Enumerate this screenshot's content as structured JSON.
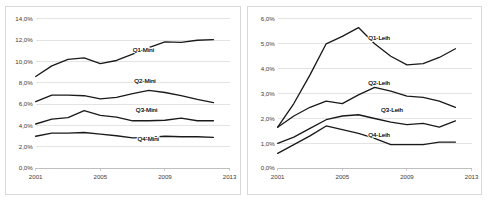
{
  "page": {
    "background_color": "#ffffff",
    "frame_border_color": "#d9d9d9",
    "line_color": "#1a1a1a",
    "gridline_color": "#d0d0d0"
  },
  "chart_data": [
    {
      "type": "line",
      "id": "chart-left-mini",
      "title": "",
      "xlabel": "",
      "ylabel": "",
      "grid": true,
      "legend_position": "inline-labels",
      "xlim": [
        2001,
        2013
      ],
      "ylim": [
        0,
        14
      ],
      "ytick_labels": [
        "0,0%",
        "2,0%",
        "4,0%",
        "6,0%",
        "8,0%",
        "10,0%",
        "12,0%",
        "14,0%"
      ],
      "ytick_values": [
        0,
        2,
        4,
        6,
        8,
        10,
        12,
        14
      ],
      "xtick_labels": [
        "2001",
        "2005",
        "2009",
        "2013"
      ],
      "xtick_values": [
        2001,
        2005,
        2009,
        2013
      ],
      "x": [
        2001,
        2002,
        2003,
        2004,
        2005,
        2006,
        2007,
        2008,
        2009,
        2010,
        2011,
        2012
      ],
      "series": [
        {
          "name": "Q1-Mini",
          "label": "Q1-Mini",
          "label_x": 2007.0,
          "label_y": 10.9,
          "values": [
            8.6,
            9.6,
            10.2,
            10.35,
            9.8,
            10.1,
            10.7,
            11.3,
            11.85,
            11.8,
            12.0,
            12.05
          ]
        },
        {
          "name": "Q2-Mini",
          "label": "Q2-Mini",
          "label_x": 2007.1,
          "label_y": 8.0,
          "values": [
            6.25,
            6.85,
            6.85,
            6.8,
            6.5,
            6.65,
            7.0,
            7.3,
            7.1,
            6.8,
            6.45,
            6.15
          ]
        },
        {
          "name": "Q3-Mini",
          "label": "Q3-Mini",
          "label_x": 2007.2,
          "label_y": 5.25,
          "values": [
            4.15,
            4.6,
            4.75,
            5.4,
            4.95,
            4.8,
            4.45,
            4.45,
            4.5,
            4.7,
            4.45,
            4.45
          ]
        },
        {
          "name": "Q4-Mini",
          "label": "Q4-Mini",
          "label_x": 2007.3,
          "label_y": 2.55,
          "values": [
            3.0,
            3.3,
            3.3,
            3.35,
            3.2,
            3.05,
            2.85,
            2.9,
            3.0,
            2.95,
            2.95,
            2.9
          ]
        }
      ]
    },
    {
      "type": "line",
      "id": "chart-right-leih",
      "title": "",
      "xlabel": "",
      "ylabel": "",
      "grid": true,
      "legend_position": "inline-labels",
      "xlim": [
        2001,
        2013
      ],
      "ylim": [
        0,
        6
      ],
      "ytick_labels": [
        "0,0%",
        "1,0%",
        "2,0%",
        "3,0%",
        "4,0%",
        "5,0%",
        "6,0%"
      ],
      "ytick_values": [
        0,
        1,
        2,
        3,
        4,
        5,
        6
      ],
      "xtick_labels": [
        "2001",
        "2005",
        "2009",
        "2013"
      ],
      "xtick_values": [
        2001,
        2005,
        2009,
        2013
      ],
      "x": [
        2001,
        2002,
        2003,
        2004,
        2005,
        2006,
        2007,
        2008,
        2009,
        2010,
        2011,
        2012
      ],
      "series": [
        {
          "name": "Q1-Leih",
          "label": "Q1-Leih",
          "label_x": 2006.6,
          "label_y": 5.15,
          "values": [
            1.65,
            2.6,
            3.75,
            5.0,
            5.3,
            5.65,
            5.0,
            4.5,
            4.15,
            4.2,
            4.45,
            4.8
          ]
        },
        {
          "name": "Q2-Leih",
          "label": "Q2-Leih",
          "label_x": 2006.6,
          "label_y": 3.35,
          "values": [
            1.65,
            2.1,
            2.45,
            2.7,
            2.6,
            2.95,
            3.25,
            3.1,
            2.9,
            2.85,
            2.7,
            2.45
          ]
        },
        {
          "name": "Q3-Leih",
          "label": "Q3-Leih",
          "label_x": 2007.4,
          "label_y": 2.25,
          "values": [
            1.0,
            1.25,
            1.6,
            1.95,
            2.1,
            2.15,
            2.0,
            1.85,
            1.75,
            1.8,
            1.65,
            1.9
          ]
        },
        {
          "name": "Q4-Leih",
          "label": "Q4-Leih",
          "label_x": 2006.6,
          "label_y": 1.25,
          "values": [
            0.6,
            0.95,
            1.3,
            1.7,
            1.55,
            1.4,
            1.2,
            0.95,
            0.95,
            0.95,
            1.05,
            1.05
          ]
        }
      ]
    }
  ]
}
